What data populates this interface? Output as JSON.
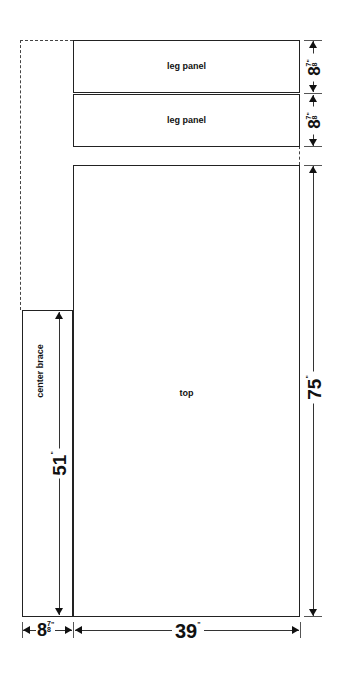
{
  "diagram": {
    "type": "cutting-layout",
    "pieces": [
      {
        "id": "leg-panel-1",
        "label": "leg panel"
      },
      {
        "id": "leg-panel-2",
        "label": "leg panel"
      },
      {
        "id": "top",
        "label": "top"
      },
      {
        "id": "center-brace",
        "label": "center brace"
      }
    ],
    "dimensions": {
      "leg_panel_1_height": {
        "whole": "8",
        "num": "7",
        "den": "8",
        "unit": "\""
      },
      "leg_panel_2_height": {
        "whole": "8",
        "num": "7",
        "den": "8",
        "unit": "\""
      },
      "top_height": {
        "value": "75",
        "unit": "\""
      },
      "center_brace_height": {
        "value": "51",
        "unit": "\""
      },
      "center_brace_width": {
        "whole": "8",
        "num": "7",
        "den": "8",
        "unit": "\""
      },
      "top_width": {
        "value": "39",
        "unit": "\""
      }
    }
  }
}
